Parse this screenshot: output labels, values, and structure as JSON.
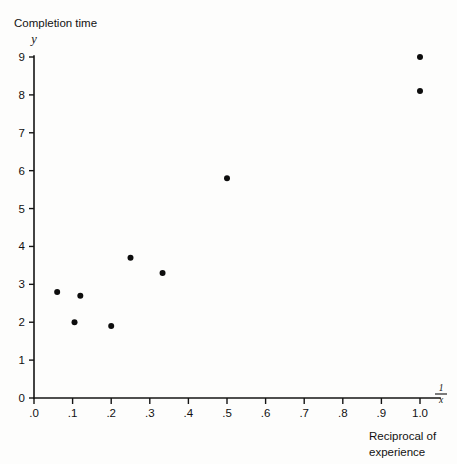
{
  "chart_data": {
    "type": "scatter",
    "title": "",
    "ylabel_text": "Completion time",
    "ylabel_var": "y",
    "xlabel_numerator": "1",
    "xlabel_denominator": "x",
    "xlabel_caption_line1": "Reciprocal of",
    "xlabel_caption_line2": "experience",
    "xlim": [
      0.0,
      1.05
    ],
    "ylim": [
      0,
      9.3
    ],
    "grid": false,
    "legend": "none",
    "point_color": "#0d0d0d",
    "axis_color": "#141414",
    "background_color": "#fdfdfc",
    "xticks": [
      0.0,
      0.1,
      0.2,
      0.3,
      0.4,
      0.5,
      0.6,
      0.7,
      0.8,
      0.9,
      1.0
    ],
    "xtick_labels": [
      ".0",
      ".1",
      ".2",
      ".3",
      ".4",
      ".5",
      ".6",
      ".7",
      ".8",
      ".9",
      "1.0"
    ],
    "yticks": [
      0,
      1,
      2,
      3,
      4,
      5,
      6,
      7,
      8,
      9
    ],
    "ytick_labels": [
      "0",
      "1",
      "2",
      "3",
      "4",
      "5",
      "6",
      "7",
      "8",
      "9"
    ],
    "points": [
      {
        "x": 0.06,
        "y": 2.8
      },
      {
        "x": 0.105,
        "y": 2.0
      },
      {
        "x": 0.12,
        "y": 2.7
      },
      {
        "x": 0.2,
        "y": 1.9
      },
      {
        "x": 0.25,
        "y": 3.7
      },
      {
        "x": 0.333,
        "y": 3.3
      },
      {
        "x": 0.5,
        "y": 5.8
      },
      {
        "x": 1.0,
        "y": 8.1
      },
      {
        "x": 1.0,
        "y": 9.0
      }
    ]
  }
}
